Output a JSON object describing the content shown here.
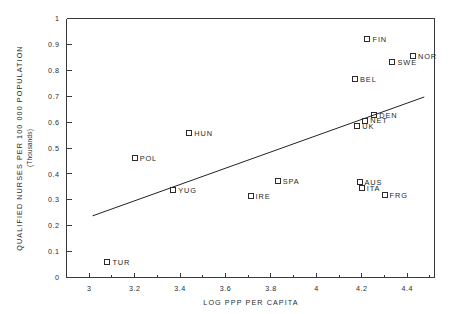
{
  "chart_data": {
    "type": "scatter",
    "title": "",
    "xlabel": "LOG PPP PER CAPITA",
    "ylabel": "QUALIFIED NURSES PER 100 000 POPULATION",
    "ylabel_sub": "(Thousands)",
    "xlim": [
      2.9,
      4.52
    ],
    "ylim": [
      0,
      1
    ],
    "grid": false,
    "legend": "none",
    "xticks": [
      "3",
      "3.2",
      "3.4",
      "3.6",
      "3.8",
      "4",
      "4.2",
      "4.4"
    ],
    "xtick_values": [
      3,
      3.2,
      3.4,
      3.6,
      3.8,
      4,
      4.2,
      4.4
    ],
    "xminor_step": 0.1,
    "yticks": [
      "0",
      "0.1",
      "0.2",
      "0.3",
      "0.4",
      "0.5",
      "0.6",
      "0.7",
      "0.8",
      "0.9",
      "1"
    ],
    "ytick_values": [
      0,
      0.1,
      0.2,
      0.3,
      0.4,
      0.5,
      0.6,
      0.7,
      0.8,
      0.9,
      1
    ],
    "marker": "open-square",
    "points": [
      {
        "label": "TUR",
        "x": 3.08,
        "y": 0.06,
        "label_side": "right"
      },
      {
        "label": "POL",
        "x": 3.2,
        "y": 0.461,
        "label_side": "right"
      },
      {
        "label": "YUG",
        "x": 3.37,
        "y": 0.338,
        "label_side": "right"
      },
      {
        "label": "HUN",
        "x": 3.44,
        "y": 0.556,
        "label_side": "right"
      },
      {
        "label": "IRE",
        "x": 3.71,
        "y": 0.313,
        "label_side": "right"
      },
      {
        "label": "SPA",
        "x": 3.83,
        "y": 0.371,
        "label_side": "right"
      },
      {
        "label": "BEL",
        "x": 4.17,
        "y": 0.765,
        "label_side": "right"
      },
      {
        "label": "UK",
        "x": 4.18,
        "y": 0.585,
        "label_side": "right"
      },
      {
        "label": "AUS",
        "x": 4.19,
        "y": 0.368,
        "label_side": "right"
      },
      {
        "label": "ITA",
        "x": 4.2,
        "y": 0.345,
        "label_side": "right"
      },
      {
        "label": "NET",
        "x": 4.215,
        "y": 0.606,
        "label_side": "right"
      },
      {
        "label": "FIN",
        "x": 4.225,
        "y": 0.922,
        "label_side": "right"
      },
      {
        "label": "DEN",
        "x": 4.255,
        "y": 0.628,
        "label_side": "right"
      },
      {
        "label": "FRG",
        "x": 4.3,
        "y": 0.318,
        "label_side": "right"
      },
      {
        "label": "SWE",
        "x": 4.335,
        "y": 0.831,
        "label_side": "right"
      },
      {
        "label": "NOR",
        "x": 4.425,
        "y": 0.855,
        "label_side": "right"
      }
    ],
    "trendline": {
      "name": "regression-line",
      "x_start": 3.015,
      "y_start": 0.238,
      "x_end": 4.475,
      "y_end": 0.697
    }
  }
}
